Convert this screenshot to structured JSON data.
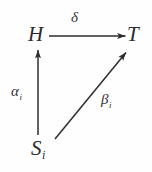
{
  "diagram": {
    "kind": "commutative-triangle",
    "background_color": "#fefefe",
    "ink_color": "#2b2b2b",
    "width": 152,
    "height": 172,
    "nodes": [
      {
        "id": "H",
        "label": "H",
        "subscript": "",
        "x": 37,
        "y": 36,
        "role": "top-left-object"
      },
      {
        "id": "T",
        "label": "T",
        "subscript": "",
        "x": 136,
        "y": 36,
        "role": "top-right-object"
      },
      {
        "id": "S",
        "label": "S",
        "subscript": "i",
        "x": 42,
        "y": 151,
        "role": "bottom-left-object"
      }
    ],
    "arrows": [
      {
        "id": "delta",
        "label": "δ",
        "subscript": "",
        "from": "H",
        "to": "T",
        "direction": "horizontal-right",
        "x1": 49,
        "y1": 36,
        "x2": 127,
        "y2": 36,
        "label_x": 77,
        "label_y": 18
      },
      {
        "id": "alpha",
        "label": "α",
        "subscript": "i",
        "from": "S",
        "to": "H",
        "direction": "vertical-up",
        "x1": 38,
        "y1": 135,
        "x2": 38,
        "y2": 48,
        "label_x": 19,
        "label_y": 94
      },
      {
        "id": "beta",
        "label": "β",
        "subscript": "i",
        "from": "S",
        "to": "T",
        "direction": "diagonal-up-right",
        "x1": 55,
        "y1": 139,
        "x2": 128,
        "y2": 50,
        "label_x": 110,
        "label_y": 102
      }
    ]
  }
}
